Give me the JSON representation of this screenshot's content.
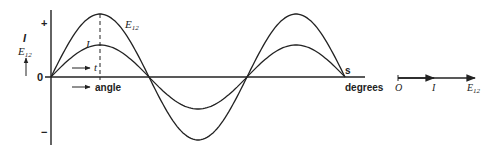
{
  "figure": {
    "wave_diagram": {
      "y_axis": {
        "plus_label": "+",
        "minus_label": "−",
        "zero_label": "0",
        "quantity_top": "I",
        "quantity_bottom": "E",
        "quantity_sub": "12"
      },
      "x_axis": {
        "end_label_s": "s",
        "end_label_degrees": "degrees",
        "angle_label": "angle",
        "time_label": "t"
      },
      "curves": [
        {
          "name": "E12",
          "label": "E",
          "sub": "12",
          "amplitude_px": 63
        },
        {
          "name": "I",
          "label": "I",
          "amplitude_px": 32
        }
      ],
      "colors": {
        "ink": "#222222"
      }
    },
    "phasor_diagram": {
      "origin_label": "O",
      "current_label": "I",
      "voltage_label": "E",
      "voltage_sub": "12"
    }
  }
}
